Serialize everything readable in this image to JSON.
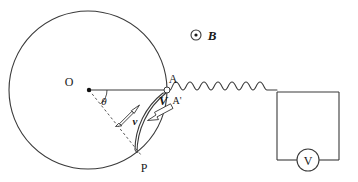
{
  "figure": {
    "type": "physics-diagram",
    "background_color": "#ffffff",
    "stroke_color": "#3a3a3a",
    "label_color": "#1a1a1a"
  },
  "labels": {
    "center": "O",
    "angle": "θ",
    "contact_top": "A",
    "contact_bottom": "A'",
    "arc_end": "P",
    "velocity": "v",
    "velocity_big": "V",
    "field": "B",
    "voltmeter": "V"
  },
  "geometry": {
    "circle": {
      "cx": 88,
      "cy": 90,
      "r": 79
    },
    "center_dot": {
      "cx": 89,
      "cy": 90,
      "r": 2.2
    },
    "contact_point": {
      "cx": 167,
      "cy": 90,
      "r": 3
    },
    "radius_line": {
      "x1": 89,
      "y1": 90,
      "x2": 167,
      "y2": 90
    },
    "dashed_radius": {
      "x1": 89,
      "y1": 90,
      "x2": 141,
      "y2": 155
    },
    "angle_arc_radius": 18,
    "angle_degrees": 51,
    "conducting_arc": {
      "from_deg": 2,
      "to_deg": 52,
      "radius": 76
    },
    "coil": {
      "x_start": 173,
      "x_end": 277,
      "y": 90,
      "humps": 6,
      "amplitude": 5
    },
    "circuit_box": {
      "x": 277,
      "y": 92,
      "w": 62,
      "h": 68
    },
    "voltmeter_symbol": {
      "cx": 308,
      "cy": 160,
      "r": 11
    },
    "field_symbol": {
      "cx": 196,
      "cy": 35,
      "r": 5,
      "dot_r": 1.6
    }
  },
  "arrows": {
    "velocity_small": {
      "label": "v",
      "from": {
        "x": 116,
        "y": 127
      },
      "to": {
        "x": 139,
        "y": 105
      },
      "style": "hollow"
    },
    "velocity_big": {
      "label": "V",
      "from": {
        "x": 171,
        "y": 105
      },
      "to": {
        "x": 148,
        "y": 120
      },
      "style": "hollow"
    }
  }
}
